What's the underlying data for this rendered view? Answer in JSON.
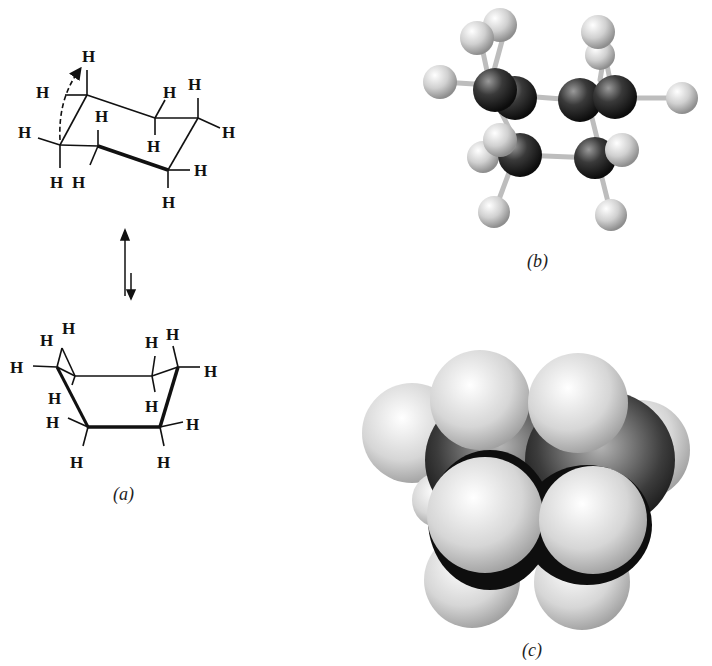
{
  "figure": {
    "panels": [
      {
        "id": "a",
        "caption": "(a)",
        "description": "Line drawings of chair conformation interconverting with boat conformation"
      },
      {
        "id": "b",
        "caption": "(b)",
        "description": "Ball-and-stick model of boat cyclohexane"
      },
      {
        "id": "c",
        "caption": "(c)",
        "description": "Space-filling model of boat cyclohexane"
      }
    ],
    "atom_label": "H",
    "equilibrium_arrow": "⇅"
  },
  "colors": {
    "carbon": "#2a2a2a",
    "hydrogen": "#d9d9d9",
    "bond": "#111111",
    "background": "#ffffff"
  }
}
